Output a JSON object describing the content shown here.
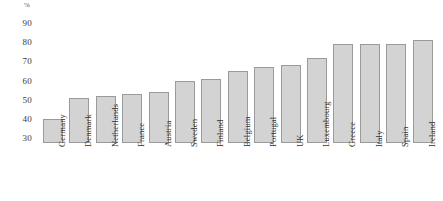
{
  "chart_data": {
    "type": "bar",
    "title": "",
    "subtitle": "",
    "xlabel": "",
    "ylabel": "%",
    "unit_label": "%",
    "ylim": [
      30,
      90
    ],
    "ytick_values": [
      30,
      40,
      50,
      60,
      70,
      80,
      90
    ],
    "ytick_labels": [
      "30",
      "40",
      "50",
      "60",
      "70",
      "80",
      "90"
    ],
    "grid": false,
    "legend": false,
    "legend_position": "none",
    "orientation": "vertical",
    "categories": [
      "Germany",
      "Denmark",
      "Netherlands",
      "France",
      "Austria",
      "Sweden",
      "Finland",
      "Belgium",
      "Portugal",
      "UK",
      "Luxembourg",
      "Greece",
      "Italy",
      "Spain",
      "Ireland"
    ],
    "values": [
      40,
      51,
      52,
      53,
      54,
      60,
      61,
      65,
      67,
      68,
      72,
      79,
      79,
      79,
      81
    ],
    "bar_fill_color": "#d3d3d3",
    "bar_border_color": "#9a9a9a",
    "axis_text_color": "#2f2f2f",
    "background_color": "#ffffff"
  }
}
